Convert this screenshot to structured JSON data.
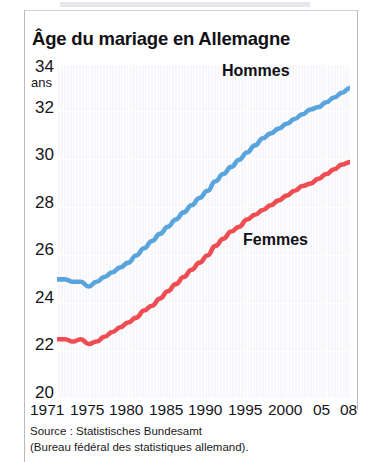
{
  "chart_data": {
    "type": "line",
    "title": "Âge du mariage en Allemagne",
    "xlabel": "",
    "ylabel": "ans",
    "ylim": [
      20,
      34
    ],
    "xlim": [
      1971,
      2008
    ],
    "grid": true,
    "legend_position": "inline-annotations",
    "y_ticks": [
      "34",
      "32",
      "30",
      "28",
      "26",
      "24",
      "22",
      "20"
    ],
    "y_tick_values": [
      34,
      32,
      30,
      28,
      26,
      24,
      22,
      20
    ],
    "y_unit_label": "ans",
    "x_ticks": [
      "1971",
      "1975",
      "1980",
      "1985",
      "1990",
      "1995",
      "2000",
      "05",
      "08"
    ],
    "x_tick_values": [
      1971,
      1975,
      1980,
      1985,
      1990,
      1995,
      2000,
      2005,
      2008
    ],
    "x": [
      1971,
      1972,
      1973,
      1974,
      1975,
      1976,
      1977,
      1978,
      1979,
      1980,
      1981,
      1982,
      1983,
      1984,
      1985,
      1986,
      1987,
      1988,
      1989,
      1990,
      1991,
      1992,
      1993,
      1994,
      1995,
      1996,
      1997,
      1998,
      1999,
      2000,
      2001,
      2002,
      2003,
      2004,
      2005,
      2006,
      2007,
      2008
    ],
    "series": [
      {
        "name": "Hommes",
        "color": "#5aa4dd",
        "values": [
          25.0,
          25.0,
          24.9,
          24.9,
          24.7,
          24.9,
          25.1,
          25.3,
          25.5,
          25.7,
          26.0,
          26.3,
          26.6,
          26.9,
          27.2,
          27.5,
          27.8,
          28.1,
          28.4,
          28.7,
          29.1,
          29.4,
          29.7,
          30.0,
          30.3,
          30.6,
          30.9,
          31.1,
          31.3,
          31.5,
          31.7,
          31.9,
          32.1,
          32.2,
          32.4,
          32.6,
          32.8,
          33.0
        ]
      },
      {
        "name": "Femmes",
        "color": "#ef4d52",
        "values": [
          22.5,
          22.5,
          22.4,
          22.5,
          22.3,
          22.4,
          22.6,
          22.8,
          23.0,
          23.2,
          23.4,
          23.7,
          23.9,
          24.2,
          24.5,
          24.8,
          25.1,
          25.4,
          25.7,
          26.0,
          26.4,
          26.7,
          27.0,
          27.2,
          27.5,
          27.7,
          27.9,
          28.1,
          28.3,
          28.5,
          28.7,
          28.9,
          29.0,
          29.2,
          29.4,
          29.6,
          29.8,
          29.9
        ]
      }
    ],
    "annotations": [
      {
        "text": "Hommes",
        "series": "Hommes"
      },
      {
        "text": "Femmes",
        "series": "Femmes"
      }
    ]
  },
  "source": {
    "line1": "Source : Statistisches Bundesamt",
    "line2": "(Bureau fédéral des statistiques allemand)."
  }
}
